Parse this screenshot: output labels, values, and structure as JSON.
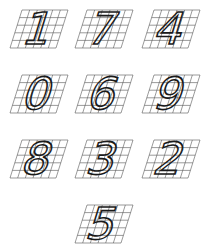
{
  "colors": {
    "grid": "#555555",
    "stroke": "#1a1a1a",
    "background": "#ffffff"
  },
  "digits": [
    {
      "digit": "1",
      "row": 0,
      "col": 0
    },
    {
      "digit": "7",
      "row": 0,
      "col": 1
    },
    {
      "digit": "4",
      "row": 0,
      "col": 2
    },
    {
      "digit": "0",
      "row": 1,
      "col": 0
    },
    {
      "digit": "6",
      "row": 1,
      "col": 1
    },
    {
      "digit": "9",
      "row": 1,
      "col": 2
    },
    {
      "digit": "8",
      "row": 2,
      "col": 0
    },
    {
      "digit": "3",
      "row": 2,
      "col": 1
    },
    {
      "digit": "2",
      "row": 2,
      "col": 2
    },
    {
      "digit": "5",
      "row": 3,
      "col": 1
    }
  ]
}
